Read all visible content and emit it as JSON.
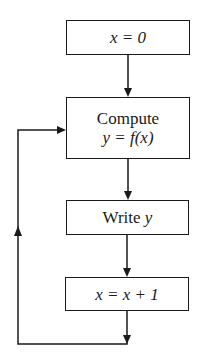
{
  "diagram": {
    "type": "flowchart",
    "nodes": [
      {
        "id": "init",
        "line1": "x = 0"
      },
      {
        "id": "compute",
        "line1": "Compute",
        "line2": "y = f(x)"
      },
      {
        "id": "write",
        "line1": "Write ",
        "line1_var": "y"
      },
      {
        "id": "increment",
        "line1": "x = x + 1"
      }
    ],
    "edges": [
      {
        "from": "init",
        "to": "compute"
      },
      {
        "from": "compute",
        "to": "write"
      },
      {
        "from": "write",
        "to": "increment"
      },
      {
        "from": "increment",
        "to": "compute",
        "kind": "loop-back"
      }
    ],
    "colors": {
      "stroke": "#1a1a1a",
      "background": "#ffffff"
    }
  }
}
